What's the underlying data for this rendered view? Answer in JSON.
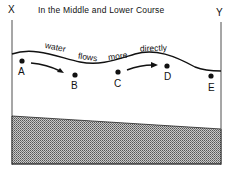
{
  "title": "In the Middle and Lower Course",
  "ends": {
    "left": "X",
    "right": "Y"
  },
  "flow_words": [
    "water",
    "flows",
    "more",
    "directly"
  ],
  "points": [
    {
      "label": "A"
    },
    {
      "label": "B"
    },
    {
      "label": "C"
    },
    {
      "label": "D"
    },
    {
      "label": "E"
    }
  ],
  "colors": {
    "ink": "#111111",
    "bedrock": "#9a9a9a"
  }
}
